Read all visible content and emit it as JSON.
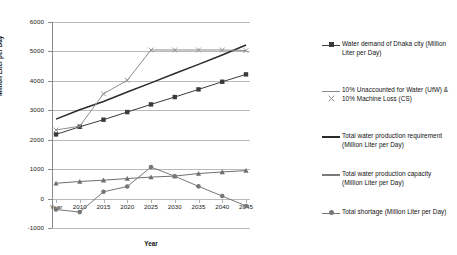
{
  "chart_data": {
    "type": "line",
    "title": "",
    "xlabel": "Year",
    "ylabel": "Million Liter per Day",
    "grid": true,
    "legend_position": "right",
    "x": [
      "Year",
      "2010",
      "2015",
      "2020",
      "2025",
      "2030",
      "2035",
      "2040",
      "2045"
    ],
    "x_tick_labels": [
      "Year",
      "2010",
      "2015",
      "2020",
      "2025",
      "2030",
      "2035",
      "2040",
      "2045"
    ],
    "y_tick_labels": [
      "6000",
      "5000",
      "4000",
      "3000",
      "2000",
      "1000",
      "0",
      "-1000"
    ],
    "ylim": [
      -1000,
      6000
    ],
    "ystep": 1000,
    "series": [
      {
        "name": "Water demand of Dhaka city (Million Liter  per Day)",
        "marker": "square",
        "color": "#3b3b3b",
        "values": [
          2180,
          2440,
          2680,
          2940,
          3200,
          3450,
          3710,
          3970,
          4220
        ]
      },
      {
        "name": "10% Unaccounted for Water (UfW) & 10% Machine Loss (CS)",
        "marker": "triangle",
        "color": "#6e6e6e",
        "values": [
          520,
          580,
          625,
          680,
          730,
          765,
          850,
          905,
          950
        ]
      },
      {
        "name": "Total water production requirement (Million Liter per Day)",
        "marker": "none",
        "color": "#2a2a2a",
        "values": [
          2700,
          3020,
          3300,
          3620,
          3930,
          4250,
          4560,
          4880,
          5220
        ]
      },
      {
        "name": "Total water production capacity (Million Liter per Day)",
        "marker": "cross",
        "color": "#8c8c8c",
        "values": [
          2330,
          2460,
          3560,
          4020,
          5050,
          5050,
          5050,
          5050,
          5030
        ]
      },
      {
        "name": "Total shortage (Million Liter per Day)",
        "marker": "circle",
        "color": "#777777",
        "values": [
          -370,
          -460,
          230,
          410,
          1070,
          760,
          415,
          85,
          -250
        ]
      }
    ]
  },
  "legend": {
    "items": [
      {
        "label": "Water demand of Dhaka city (Million\nLiter  per Day)",
        "marker": "square",
        "color": "#3b3b3b"
      },
      {
        "label": "10% Unaccounted for Water (UfW) &\n10% Machine Loss (CS)",
        "marker": "cross",
        "color": "#8a8a8a"
      },
      {
        "label": "Total water production requirement\n(Million Liter per Day)",
        "marker": "none",
        "color": "#2a2a2a"
      },
      {
        "label": "Total water production capacity\n(Million Liter per Day)",
        "marker": "none",
        "color": "#7a7a7a"
      },
      {
        "label": "Total shortage (Million Liter per Day)",
        "marker": "circle",
        "color": "#777777"
      }
    ]
  },
  "axes": {
    "y_title": "Million Liter per Day",
    "x_title": "Year"
  }
}
